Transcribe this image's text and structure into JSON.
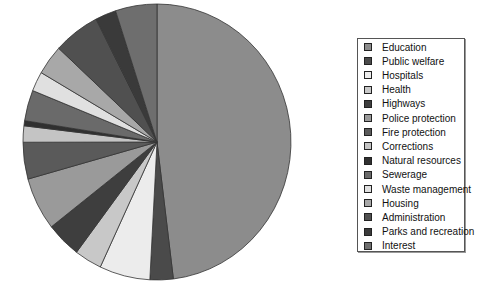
{
  "chart_data": {
    "type": "pie",
    "title": "",
    "start_angle_deg": 0,
    "direction": "clockwise",
    "legend_position": "right",
    "categories": [
      "Education",
      "Public welfare",
      "Hospitals",
      "Health",
      "Highways",
      "Police protection",
      "Fire protection",
      "Corrections",
      "Natural resources",
      "Sewerage",
      "Waste management",
      "Housing",
      "Administration",
      "Parks and recreation",
      "Interest"
    ],
    "values": [
      48.0,
      2.8,
      6.1,
      3.3,
      4.2,
      6.2,
      4.3,
      1.9,
      0.6,
      3.6,
      2.3,
      3.5,
      5.6,
      2.5,
      5.0
    ],
    "colors": [
      "#8c8c8c",
      "#4a4a4a",
      "#ececec",
      "#c8c8c8",
      "#3e3e3e",
      "#9a9a9a",
      "#5a5a5a",
      "#c4c4c4",
      "#303030",
      "#6a6a6a",
      "#e0e0e0",
      "#a8a8a8",
      "#505050",
      "#3a3a3a",
      "#6e6e6e"
    ],
    "unit": "percent (estimated)"
  },
  "legend": {
    "items": [
      {
        "label": "Education"
      },
      {
        "label": "Public welfare"
      },
      {
        "label": "Hospitals"
      },
      {
        "label": "Health"
      },
      {
        "label": "Highways"
      },
      {
        "label": "Police protection"
      },
      {
        "label": "Fire protection"
      },
      {
        "label": "Corrections"
      },
      {
        "label": "Natural resources"
      },
      {
        "label": "Sewerage"
      },
      {
        "label": "Waste management"
      },
      {
        "label": "Housing"
      },
      {
        "label": "Administration"
      },
      {
        "label": "Parks and recreation"
      },
      {
        "label": "Interest"
      }
    ]
  }
}
